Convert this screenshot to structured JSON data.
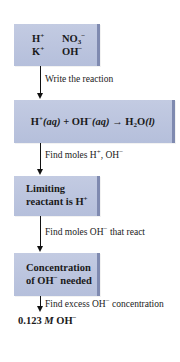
{
  "diagram": {
    "type": "flowchart",
    "colors": {
      "box_fill": "#b8c2dc",
      "box_edge": "#7f8ab0",
      "arrow": "#111111"
    },
    "steps": [
      {
        "id": "ions",
        "rows": [
          [
            "H",
            "+",
            "",
            "NO",
            "−",
            "3"
          ],
          [
            "K",
            "+",
            "",
            "OH",
            "−",
            ""
          ]
        ]
      },
      {
        "id": "reaction"
      },
      {
        "id": "limiting",
        "line1": "Limiting",
        "line2": "reactant is H",
        "line2_sup": "+"
      },
      {
        "id": "concentration",
        "line1": "Concentration",
        "line2_a": "of OH",
        "line2_sup": "−",
        "line2_b": " needed"
      }
    ],
    "ions": {
      "h": "H",
      "h_charge": "+",
      "no3": "NO",
      "no3_sub": "3",
      "no3_charge": "−",
      "k": "K",
      "k_charge": "+",
      "oh": "OH",
      "oh_charge": "−"
    },
    "reaction": {
      "h": "H",
      "h_charge": "+",
      "h_state": "(aq)",
      "plus": " + ",
      "oh": "OH",
      "oh_charge": "−",
      "oh_state": "(aq)",
      "arrow": " → ",
      "product": "H",
      "product_sub": "2",
      "product_rest": "O",
      "product_state": "(l)"
    },
    "transitions": [
      {
        "text": "Write the reaction"
      },
      {
        "text_a": "Find moles H",
        "sup_a": "+",
        "text_b": ", OH",
        "sup_b": "−"
      },
      {
        "text_a": "Find moles OH",
        "sup_a": "−",
        "text_b": " that react"
      },
      {
        "text_a": "Find excess OH",
        "sup_a": "−",
        "text_b": " concentration"
      }
    ],
    "result": {
      "value": "0.123 ",
      "unit": "M",
      "species": " OH",
      "charge": "−"
    }
  }
}
